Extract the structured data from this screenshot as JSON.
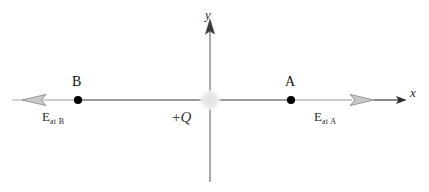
{
  "figure": {
    "background_color": "#ffffff",
    "width": 429,
    "height": 192
  },
  "axes": {
    "x_label": "x",
    "y_label": "y",
    "origin": {
      "x": 210,
      "y": 100
    },
    "x_axis_color": "#2b2b2b",
    "y_axis_color": "#6e6e6e"
  },
  "charge": {
    "label_sign": "+",
    "label_symbol": "Q",
    "label": "+Q",
    "color": "#ececec",
    "center_x": 210,
    "center_y": 100,
    "radius": 10
  },
  "points": [
    {
      "name": "B",
      "label": "B",
      "x": 78,
      "y": 100,
      "marker_color": "#000000"
    },
    {
      "name": "A",
      "label": "A",
      "x": 291,
      "y": 100,
      "marker_color": "#000000"
    }
  ],
  "field_vectors": [
    {
      "name": "field-at-b",
      "label_symbol": "E",
      "label_subscript": "at B",
      "direction": "left",
      "color": "#9a9a9a",
      "tail_x": 78,
      "head_x": 12,
      "y": 100
    },
    {
      "name": "field-at-a",
      "label_symbol": "E",
      "label_subscript": "at A",
      "direction": "right",
      "color": "#9a9a9a",
      "tail_x": 291,
      "head_x": 374,
      "y": 100
    }
  ]
}
